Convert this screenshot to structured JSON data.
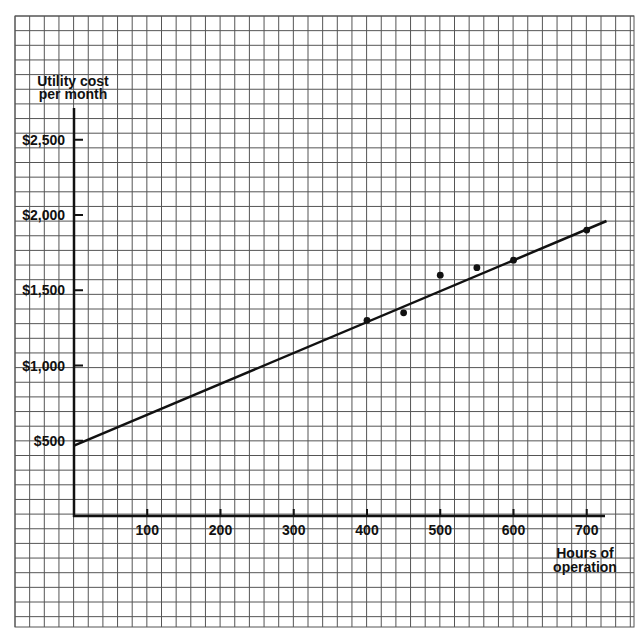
{
  "chart_data": {
    "type": "scatter",
    "title": "",
    "xlabel": "Hours of operation",
    "ylabel": "Utility cost per month",
    "xlabel_lines": [
      "Hours of",
      "operation"
    ],
    "ylabel_lines": [
      "Utility cost",
      "per month"
    ],
    "x_ticks": [
      100,
      200,
      300,
      400,
      500,
      600,
      700
    ],
    "x_tick_labels": [
      "100",
      "200",
      "300",
      "400",
      "500",
      "600",
      "700"
    ],
    "y_ticks": [
      500,
      1000,
      1500,
      2000,
      2500
    ],
    "y_tick_labels": [
      "$500",
      "$1,000",
      "$1,500",
      "$2,000",
      "$2,500"
    ],
    "xlim": [
      0,
      727
    ],
    "ylim": [
      0,
      2720
    ],
    "grid": true,
    "legend": null,
    "series": [
      {
        "name": "Observed months",
        "kind": "scatter",
        "x": [
          400,
          450,
          500,
          550,
          600,
          700
        ],
        "y": [
          1300,
          1350,
          1600,
          1650,
          1700,
          1900
        ]
      },
      {
        "name": "Fitted line",
        "kind": "line",
        "x": [
          0,
          727
        ],
        "y": [
          467,
          1960
        ]
      }
    ]
  },
  "style": {
    "ink": "#111111",
    "grid": "#555555",
    "background": "#ffffff"
  }
}
